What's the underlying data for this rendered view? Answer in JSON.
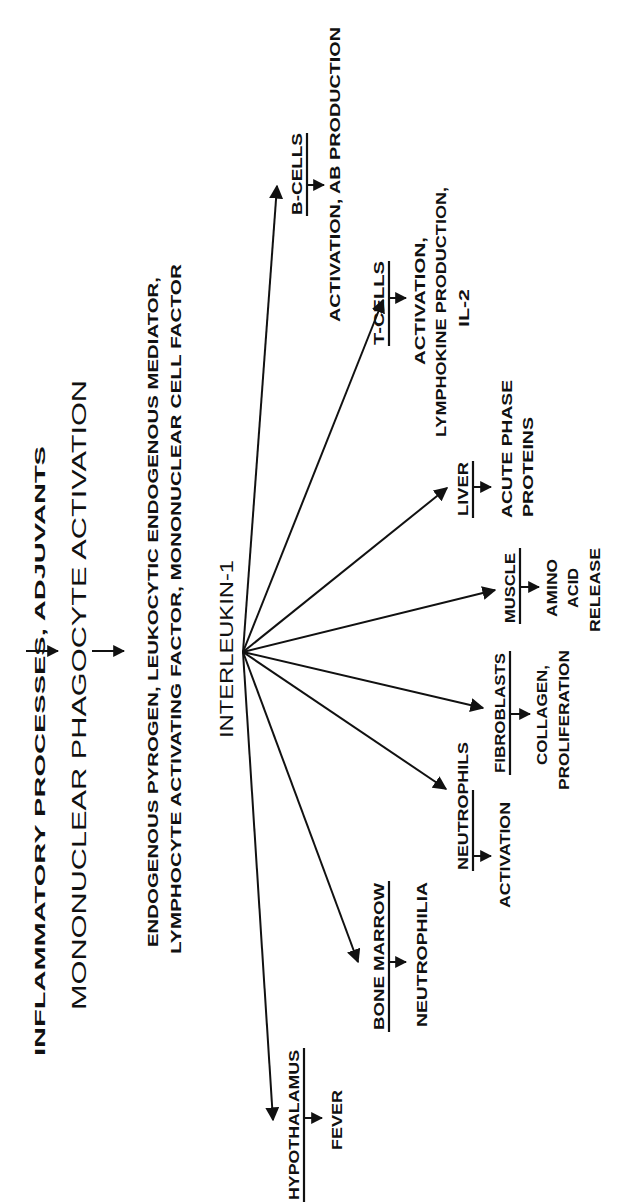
{
  "orientation": "rotated-90-ccw",
  "colors": {
    "ink": "#111111",
    "background": "#ffffff"
  },
  "header": {
    "source_line": "INFLAMMATORY PROCESSES, ADJUVANTS",
    "activation_line": "MONONUCLEAR PHAGOCYTE ACTIVATION",
    "synonyms_line1": "ENDOGENOUS PYROGEN, LEUKOCYTIC ENDOGENOUS MEDIATOR,",
    "synonyms_line2": "LYMPHOCYTE  ACTIVATING FACTOR, MONONUCLEAR CELL FACTOR"
  },
  "hub": {
    "label": "INTERLEUKIN-1"
  },
  "targets": [
    {
      "name": "B-CELLS",
      "effect": [
        "ACTIVATION, AB PRODUCTION"
      ]
    },
    {
      "name": "T-CELLS",
      "effect": [
        "ACTIVATION,",
        "LYMPHOKINE PRODUCTION,",
        "IL-2"
      ]
    },
    {
      "name": "LIVER",
      "effect": [
        "ACUTE PHASE",
        "PROTEINS"
      ]
    },
    {
      "name": "MUSCLE",
      "effect": [
        "AMINO",
        "ACID",
        "RELEASE"
      ]
    },
    {
      "name": "FIBROBLASTS",
      "effect": [
        "COLLAGEN,",
        "PROLIFERATION"
      ]
    },
    {
      "name": "NEUTROPHILS",
      "effect": [
        "ACTIVATION"
      ]
    },
    {
      "name": "BONE MARROW",
      "effect": [
        "NEUTROPHILIA"
      ]
    },
    {
      "name": "HYPOTHALAMUS",
      "effect": [
        "FEVER"
      ]
    }
  ]
}
